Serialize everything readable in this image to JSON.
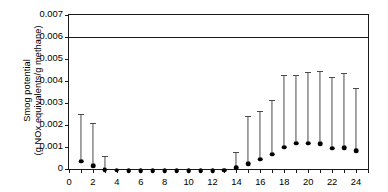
{
  "chart_data": {
    "type": "scatter",
    "title": "",
    "xlabel": "",
    "ylabel_line1": "Smog potential",
    "ylabel_line2": "(g NOx equivalents/g methane)",
    "xlim": [
      0,
      25
    ],
    "ylim": [
      0,
      0.007
    ],
    "grid": false,
    "legend": "none",
    "x_ticks": [
      0,
      1,
      2,
      3,
      4,
      5,
      6,
      7,
      8,
      9,
      10,
      11,
      12,
      13,
      14,
      15,
      16,
      17,
      18,
      19,
      20,
      21,
      22,
      23,
      24,
      25
    ],
    "x_tick_labels": [
      "0",
      "",
      "2",
      "",
      "4",
      "",
      "6",
      "",
      "8",
      "",
      "10",
      "",
      "12",
      "",
      "14",
      "",
      "16",
      "",
      "18",
      "",
      "20",
      "",
      "22",
      "",
      "24",
      ""
    ],
    "y_ticks": [
      0,
      0.001,
      0.002,
      0.003,
      0.004,
      0.005,
      0.006,
      0.007
    ],
    "y_tick_labels": [
      "0",
      "0.001",
      "0.002",
      "0.003",
      "0.004",
      "0.005",
      "0.006",
      "0.007"
    ],
    "reference_line": {
      "value": 0.006,
      "label": ""
    },
    "marker": "filled-circle",
    "error_bars": "upper-only",
    "x": [
      1,
      2,
      3,
      4,
      5,
      6,
      7,
      8,
      9,
      10,
      11,
      12,
      13,
      14,
      15,
      16,
      17,
      18,
      19,
      20,
      21,
      22,
      23,
      24
    ],
    "values": [
      0.00045,
      0.00025,
      8e-05,
      4e-05,
      3e-05,
      3e-05,
      3e-05,
      3e-05,
      3e-05,
      3e-05,
      3e-05,
      3e-05,
      5e-05,
      0.00015,
      0.00035,
      0.00055,
      0.00078,
      0.0011,
      0.00128,
      0.00128,
      0.00125,
      0.00105,
      0.00107,
      0.00092
    ],
    "upper_errors": [
      0.0025,
      0.00208,
      0.0006,
      4e-05,
      3e-05,
      3e-05,
      3e-05,
      3e-05,
      3e-05,
      3e-05,
      3e-05,
      3e-05,
      5e-05,
      0.00078,
      0.00243,
      0.00265,
      0.00315,
      0.00428,
      0.00428,
      0.0044,
      0.00445,
      0.00418,
      0.00435,
      0.00367
    ]
  }
}
